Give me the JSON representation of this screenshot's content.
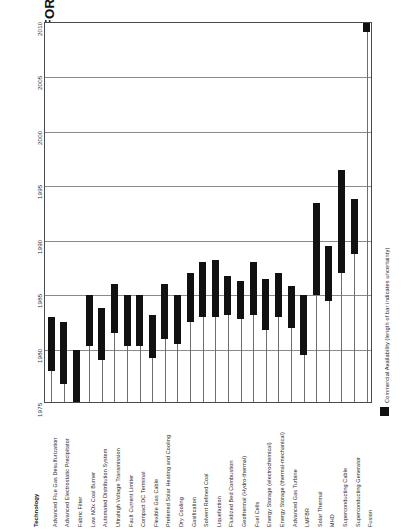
{
  "title": "KEY TECHNOLOGICAL OPTIONS FOR THE UTILITY INDUSTRY",
  "axis": {
    "category_header": "Technology",
    "year_ticks": [
      "2010",
      "2005",
      "2000",
      "1995",
      "1990",
      "1985",
      "1980",
      "1975"
    ]
  },
  "legend": {
    "label": "Commercial Availability (length of bar indicates uncertainty)",
    "swatch_color": "#111111"
  },
  "chart_data": {
    "type": "bar",
    "title": "KEY TECHNOLOGICAL OPTIONS FOR THE UTILITY INDUSTRY",
    "xlabel": "Technology",
    "ylabel": "",
    "ylim": [
      1975,
      2010
    ],
    "orientation": "vertical-range",
    "grid": true,
    "legend_position": "right",
    "value_description": "Commercial availability window; bar spans earliest to latest expected year",
    "categories": [
      "Advanced Flue Gas Desulfurization",
      "Advanced Electrostatic Precipitator",
      "Fabric Filter",
      "Low NOx Coal Burner",
      "Automated Distribution System",
      "Ultrahigh Voltage Transmission",
      "Fault Current Limiter",
      "Compact DC Terminal",
      "Flexible Gas Cable",
      "Preferred Solar Heating and Cooling",
      "Dry Cooling",
      "Gasification",
      "Solvent Refined Coal",
      "Liquefaction",
      "Fluidized Bed Combustion",
      "Geothermal (Hydro-thermal)",
      "Fuel Cells",
      "Energy Storage (electrochemical)",
      "Energy Storage (thermal-mechanical)",
      "Advanced Gas Turbine",
      "LMFBR",
      "Solar Thermal",
      "MHD",
      "Superconducting Cable",
      "Superconducting Generator",
      "Fusion"
    ],
    "bars": [
      {
        "category": "Advanced Flue Gas Desulfurization",
        "start": 1978.0,
        "end": 1983.0
      },
      {
        "category": "Advanced Electrostatic Precipitator",
        "start": 1976.8,
        "end": 1982.5
      },
      {
        "category": "Fabric Filter",
        "start": 1975.2,
        "end": 1980.0
      },
      {
        "category": "Low NOx Coal Burner",
        "start": 1980.3,
        "end": 1985.0
      },
      {
        "category": "Automated Distribution System",
        "start": 1979.0,
        "end": 1983.8
      },
      {
        "category": "Ultrahigh Voltage Transmission",
        "start": 1981.5,
        "end": 1986.0
      },
      {
        "category": "Fault Current Limiter",
        "start": 1980.3,
        "end": 1985.0
      },
      {
        "category": "Compact DC Terminal",
        "start": 1980.3,
        "end": 1985.0
      },
      {
        "category": "Flexible Gas Cable",
        "start": 1979.2,
        "end": 1983.2
      },
      {
        "category": "Preferred Solar Heating and Cooling",
        "start": 1981.0,
        "end": 1986.0
      },
      {
        "category": "Dry Cooling",
        "start": 1980.5,
        "end": 1985.0
      },
      {
        "category": "Gasification",
        "start": 1982.5,
        "end": 1987.0
      },
      {
        "category": "Solvent Refined Coal",
        "start": 1983.0,
        "end": 1988.0
      },
      {
        "category": "Liquefaction",
        "start": 1983.0,
        "end": 1988.2
      },
      {
        "category": "Fluidized Bed Combustion",
        "start": 1983.2,
        "end": 1986.8
      },
      {
        "category": "Geothermal (Hydro-thermal)",
        "start": 1982.8,
        "end": 1986.3
      },
      {
        "category": "Fuel Cells",
        "start": 1983.2,
        "end": 1988.0
      },
      {
        "category": "Energy Storage (electrochemical)",
        "start": 1981.8,
        "end": 1986.5
      },
      {
        "category": "Energy Storage (thermal-mechanical)",
        "start": 1983.0,
        "end": 1987.0
      },
      {
        "category": "Advanced Gas Turbine",
        "start": 1982.0,
        "end": 1985.8
      },
      {
        "category": "LMFBR",
        "start": 1979.5,
        "end": 1985.0
      },
      {
        "category": "Solar Thermal",
        "start": 1985.0,
        "end": 1993.5
      },
      {
        "category": "MHD",
        "start": 1984.5,
        "end": 1989.5
      },
      {
        "category": "Superconducting Cable",
        "start": 1987.0,
        "end": 1996.5
      },
      {
        "category": "Superconducting Generator",
        "start": 1988.8,
        "end": 1993.8
      },
      {
        "category": "Fusion",
        "start": 2009.2,
        "end": 2011.0
      }
    ]
  }
}
